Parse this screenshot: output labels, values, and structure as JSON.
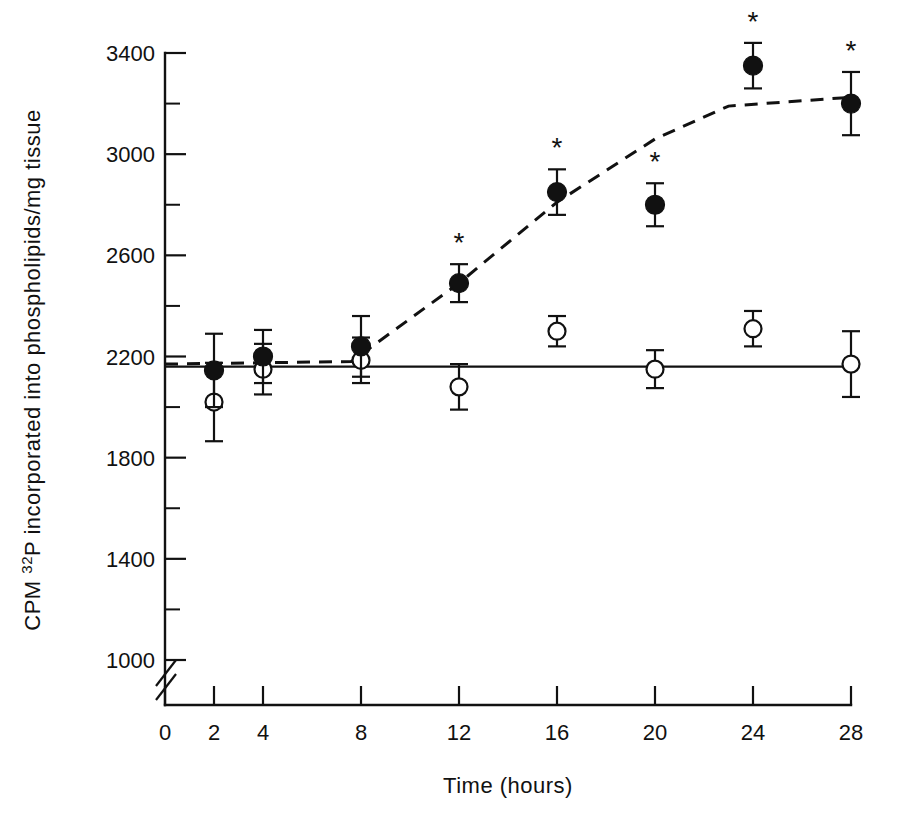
{
  "chart_data": {
    "type": "line",
    "title": "",
    "xlabel": "Time (hours)",
    "ylabel": "CPM 32P incorporated into phospholipids/mg tissue",
    "ylabel_prefix": "CPM ",
    "ylabel_sup": "32",
    "ylabel_suffix": "P incorporated into phospholipids/mg tissue",
    "x": [
      2,
      4,
      8,
      12,
      16,
      20,
      24,
      28
    ],
    "xticks": [
      0,
      2,
      4,
      8,
      12,
      16,
      20,
      24,
      28
    ],
    "xticklabels": [
      "0",
      "2",
      "4",
      "8",
      "12",
      "16",
      "20",
      "24",
      "28"
    ],
    "yticks": [
      1000,
      1400,
      1800,
      2200,
      2600,
      3000,
      3400
    ],
    "yticklabels": [
      "1000",
      "1400",
      "1800",
      "2200",
      "2600",
      "3000",
      "3400"
    ],
    "yminorticks": [
      1200,
      1600,
      2000,
      2400,
      2800,
      3200
    ],
    "ylim": [
      900,
      3400
    ],
    "xlim": [
      0,
      28
    ],
    "axis_break": true,
    "grid": false,
    "legend": "none",
    "significance_marker": "*",
    "series": [
      {
        "name": "treated",
        "marker": "filled-circle",
        "linestyle": "dashed",
        "values": [
          2145,
          2200,
          2240,
          2490,
          2850,
          2800,
          3350,
          3200
        ],
        "errors": [
          145,
          105,
          120,
          75,
          90,
          85,
          90,
          125
        ],
        "significant": [
          false,
          false,
          false,
          true,
          true,
          true,
          true,
          true
        ]
      },
      {
        "name": "control",
        "marker": "open-circle",
        "linestyle": "solid",
        "values": [
          2020,
          2150,
          2185,
          2080,
          2300,
          2150,
          2310,
          2170
        ],
        "errors": [
          155,
          100,
          90,
          90,
          60,
          75,
          70,
          130
        ],
        "significant": [
          false,
          false,
          false,
          false,
          false,
          false,
          false,
          false
        ]
      }
    ],
    "trend_solid_y": 2160,
    "trend_dashed_points": [
      {
        "x": 0.0,
        "y": 2170
      },
      {
        "x": 7.6,
        "y": 2180
      },
      {
        "x": 12.0,
        "y": 2490
      },
      {
        "x": 16.0,
        "y": 2810
      },
      {
        "x": 20.0,
        "y": 3060
      },
      {
        "x": 23.0,
        "y": 3190
      },
      {
        "x": 28.0,
        "y": 3225
      }
    ]
  }
}
